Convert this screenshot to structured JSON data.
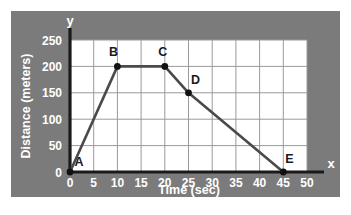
{
  "panel": {
    "background_color": "#7b7b7b",
    "plot_background_color": "#ffffff",
    "grid_color": "#9a9a9a",
    "axis_color": "#1a1a1a",
    "series_color": "#4a4a4a",
    "marker_color": "#111111",
    "label_color": "#ffffff"
  },
  "axes": {
    "y_axis_letter": "y",
    "x_axis_letter": "x"
  },
  "chart_data": {
    "type": "line",
    "title": "",
    "xlabel": "Time (sec)",
    "ylabel": "Distance (meters)",
    "xlim": [
      0,
      50
    ],
    "ylim": [
      0,
      250
    ],
    "grid": true,
    "legend": "none",
    "xticks": [
      0,
      5,
      10,
      15,
      20,
      25,
      30,
      35,
      40,
      45,
      50
    ],
    "xtick_labels": [
      "0",
      "5",
      "10",
      "15",
      "20",
      "25",
      "30",
      "35",
      "40",
      "45",
      "50"
    ],
    "yticks": [
      0,
      50,
      100,
      150,
      200,
      250
    ],
    "ytick_labels": [
      "0",
      "50",
      "100",
      "150",
      "200",
      "250"
    ],
    "series": [
      {
        "name": "Distance vs Time",
        "x": [
          0,
          10,
          20,
          25,
          45
        ],
        "y": [
          0,
          200,
          200,
          150,
          0
        ],
        "point_labels": [
          "A",
          "B",
          "C",
          "D",
          "E"
        ]
      }
    ],
    "annotations": [
      {
        "label": "A",
        "x": 0,
        "y": 0,
        "dx": 9,
        "dy": -6
      },
      {
        "label": "B",
        "x": 10,
        "y": 200,
        "dx": -4,
        "dy": -10
      },
      {
        "label": "C",
        "x": 20,
        "y": 200,
        "dx": -2,
        "dy": -10
      },
      {
        "label": "D",
        "x": 25,
        "y": 150,
        "dx": 7,
        "dy": -9
      },
      {
        "label": "E",
        "x": 45,
        "y": 0,
        "dx": 6,
        "dy": -9
      }
    ]
  }
}
